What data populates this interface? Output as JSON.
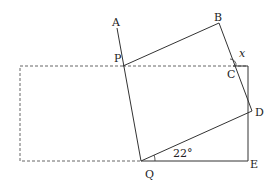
{
  "diagram": {
    "type": "geometry-figure",
    "points": {
      "A": {
        "label": "A",
        "x": 117,
        "y": 28
      },
      "B": {
        "label": "B",
        "x": 219,
        "y": 23
      },
      "P": {
        "label": "P",
        "x": 123,
        "y": 66
      },
      "C": {
        "label": "C",
        "x": 233,
        "y": 66
      },
      "D": {
        "label": "D",
        "x": 252,
        "y": 111
      },
      "Q": {
        "label": "Q",
        "x": 141,
        "y": 161
      },
      "E": {
        "label": "E",
        "x": 248,
        "y": 161
      }
    },
    "angle_labels": {
      "known": "22°",
      "unknown": "x"
    },
    "colors": {
      "line": "#333333",
      "dashed": "#666666"
    }
  }
}
